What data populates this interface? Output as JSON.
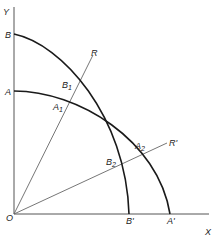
{
  "diagram": {
    "type": "production-possibility-curves",
    "axes": {
      "x_label": "X",
      "y_label": "Y",
      "origin_label": "O"
    },
    "curves": [
      {
        "name": "BB'",
        "start_label": "B",
        "end_label": "B'"
      },
      {
        "name": "AA'",
        "start_label": "A",
        "end_label": "A'"
      }
    ],
    "rays": [
      {
        "name": "OR",
        "end_label": "R",
        "points": [
          {
            "base": "B",
            "sub": "1"
          },
          {
            "base": "A",
            "sub": "1"
          }
        ]
      },
      {
        "name": "OR'",
        "end_label": "R'",
        "points": [
          {
            "base": "A",
            "sub": "2"
          },
          {
            "base": "B",
            "sub": "2"
          }
        ]
      }
    ],
    "colors": {
      "curve": "#1a1a1a",
      "axis": "#555555",
      "ray": "#666666",
      "background": "#ffffff"
    }
  }
}
